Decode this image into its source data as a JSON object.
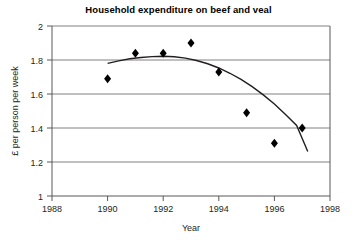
{
  "chart_data": {
    "type": "scatter",
    "title": "Household expenditure on beef and veal",
    "xlabel": "Year",
    "ylabel": "£ per person per week",
    "xlim": [
      1988,
      1998
    ],
    "ylim": [
      1,
      2
    ],
    "xticks": [
      "1988",
      "1990",
      "1992",
      "1994",
      "1996",
      "1998"
    ],
    "yticks": [
      "1",
      "1.2",
      "1.4",
      "1.6",
      "1.8",
      "2"
    ],
    "grid": "horizontal",
    "legend": "none",
    "x": [
      1990,
      1991,
      1992,
      1993,
      1994,
      1995,
      1996,
      1997
    ],
    "values": [
      1.69,
      1.84,
      1.84,
      1.9,
      1.73,
      1.49,
      1.31,
      1.4
    ],
    "series": [
      {
        "name": "Household expenditure on beef and veal",
        "marker": "diamond",
        "color": "#000000",
        "x": [
          1990,
          1991,
          1992,
          1993,
          1994,
          1995,
          1996,
          1997
        ],
        "values": [
          1.69,
          1.84,
          1.84,
          1.9,
          1.73,
          1.49,
          1.31,
          1.4
        ]
      }
    ],
    "trendline": {
      "name": "fitted curve",
      "type": "quadratic",
      "color": "#231f20",
      "x": [
        1990,
        1990.4,
        1990.8,
        1991.2,
        1991.6,
        1992,
        1992.4,
        1992.8,
        1993.2,
        1993.6,
        1994,
        1994.4,
        1994.8,
        1995.2,
        1995.6,
        1996,
        1996.4,
        1996.8,
        1997.2
      ],
      "values": [
        1.78,
        1.795,
        1.807,
        1.815,
        1.82,
        1.822,
        1.819,
        1.811,
        1.797,
        1.778,
        1.753,
        1.722,
        1.686,
        1.643,
        1.595,
        1.541,
        1.48,
        1.415,
        1.262
      ]
    }
  },
  "axes": {
    "y_tick_values": [
      1,
      1.2,
      1.4,
      1.6,
      1.8,
      2
    ],
    "x_tick_values": [
      1988,
      1990,
      1992,
      1994,
      1996,
      1998
    ]
  }
}
